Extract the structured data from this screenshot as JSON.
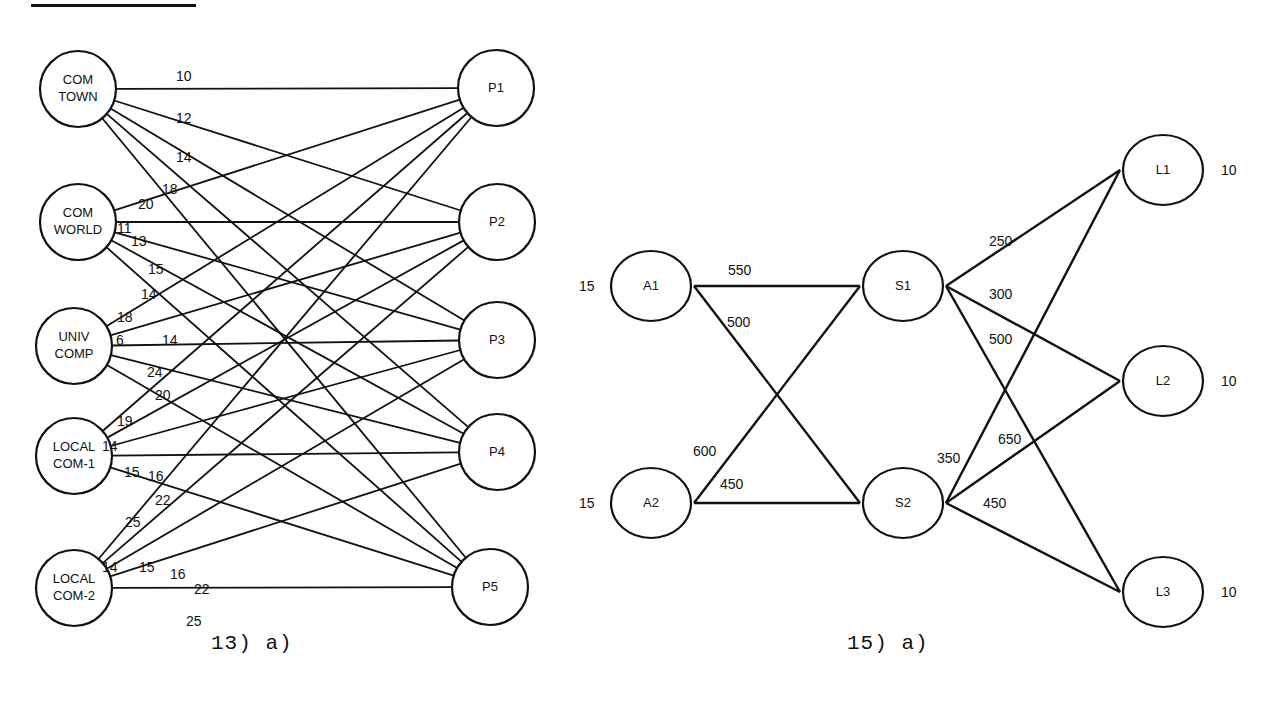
{
  "figures": [
    {
      "caption": "13) a)",
      "sources": [
        {
          "id": "ct",
          "line1": "COM",
          "line2": "TOWN",
          "cx": 78,
          "cy": 89
        },
        {
          "id": "cw",
          "line1": "COM",
          "line2": "WORLD",
          "cx": 78,
          "cy": 222
        },
        {
          "id": "uc",
          "line1": "UNIV",
          "line2": "COMP",
          "cx": 74,
          "cy": 346
        },
        {
          "id": "l1",
          "line1": "LOCAL",
          "line2": "COM-1",
          "cx": 74,
          "cy": 456
        },
        {
          "id": "l2",
          "line1": "LOCAL",
          "line2": "COM-2",
          "cx": 74,
          "cy": 588
        }
      ],
      "destinations": [
        {
          "id": "p1",
          "label": "P1",
          "cx": 496,
          "cy": 88
        },
        {
          "id": "p2",
          "label": "P2",
          "cx": 497,
          "cy": 222
        },
        {
          "id": "p3",
          "label": "P3",
          "cx": 497,
          "cy": 340
        },
        {
          "id": "p4",
          "label": "P4",
          "cx": 497,
          "cy": 452
        },
        {
          "id": "p5",
          "label": "P5",
          "cx": 490,
          "cy": 587
        }
      ],
      "costs": {
        "COM TOWN": [
          "10",
          "12",
          "14",
          "18",
          "20"
        ],
        "COM WORLD": [
          "11",
          "13",
          "15",
          "14",
          "18"
        ],
        "UNIV COMP": [
          "6",
          "14",
          "24",
          "20",
          "19"
        ],
        "LOCAL COM-1": [
          "14",
          "15",
          "16",
          "22",
          "25"
        ],
        "LOCAL COM-2": [
          "14",
          "15",
          "16",
          "22",
          "25"
        ]
      },
      "cost_labels": [
        {
          "text": "10",
          "x": 176,
          "y": 81
        },
        {
          "text": "12",
          "x": 176,
          "y": 123
        },
        {
          "text": "14",
          "x": 176,
          "y": 162
        },
        {
          "text": "18",
          "x": 162,
          "y": 194
        },
        {
          "text": "20",
          "x": 138,
          "y": 209
        },
        {
          "text": "11",
          "x": 117,
          "y": 233
        },
        {
          "text": "13",
          "x": 131,
          "y": 246
        },
        {
          "text": "15",
          "x": 148,
          "y": 274
        },
        {
          "text": "14",
          "x": 141,
          "y": 299
        },
        {
          "text": "18",
          "x": 117,
          "y": 322
        },
        {
          "text": "6",
          "x": 116,
          "y": 345
        },
        {
          "text": "14",
          "x": 162,
          "y": 345
        },
        {
          "text": "24",
          "x": 147,
          "y": 377
        },
        {
          "text": "20",
          "x": 155,
          "y": 400
        },
        {
          "text": "19",
          "x": 117,
          "y": 426
        },
        {
          "text": "14",
          "x": 102,
          "y": 451
        },
        {
          "text": "15",
          "x": 124,
          "y": 477
        },
        {
          "text": "16",
          "x": 148,
          "y": 481
        },
        {
          "text": "22",
          "x": 155,
          "y": 505
        },
        {
          "text": "25",
          "x": 125,
          "y": 527
        },
        {
          "text": "14",
          "x": 102,
          "y": 572
        },
        {
          "text": "15",
          "x": 139,
          "y": 572
        },
        {
          "text": "16",
          "x": 170,
          "y": 579
        },
        {
          "text": "22",
          "x": 194,
          "y": 594
        },
        {
          "text": "25",
          "x": 186,
          "y": 626
        }
      ]
    },
    {
      "caption": "15) a)",
      "nodes": [
        {
          "id": "a1",
          "label": "A1",
          "cx": 651,
          "cy": 286,
          "side_value": "15",
          "side": "left"
        },
        {
          "id": "a2",
          "label": "A2",
          "cx": 651,
          "cy": 503,
          "side_value": "15",
          "side": "left"
        },
        {
          "id": "s1",
          "label": "S1",
          "cx": 903,
          "cy": 286
        },
        {
          "id": "s2",
          "label": "S2",
          "cx": 903,
          "cy": 503
        },
        {
          "id": "L1",
          "label": "L1",
          "cx": 1163,
          "cy": 170,
          "side_value": "10",
          "side": "right"
        },
        {
          "id": "L2",
          "label": "L2",
          "cx": 1163,
          "cy": 381,
          "side_value": "10",
          "side": "right"
        },
        {
          "id": "L3",
          "label": "L3",
          "cx": 1163,
          "cy": 592,
          "side_value": "10",
          "side": "right"
        }
      ],
      "edges": [
        {
          "from": "A1",
          "to": "S1",
          "cost": "550"
        },
        {
          "from": "A1",
          "to": "S2",
          "cost": "500"
        },
        {
          "from": "A2",
          "to": "S1",
          "cost": "600"
        },
        {
          "from": "A2",
          "to": "S2",
          "cost": "450"
        },
        {
          "from": "S1",
          "to": "L1",
          "cost": "250"
        },
        {
          "from": "S1",
          "to": "L2",
          "cost": "300"
        },
        {
          "from": "S1",
          "to": "L3",
          "cost": "500"
        },
        {
          "from": "S2",
          "to": "L1",
          "cost": "350"
        },
        {
          "from": "S2",
          "to": "L2",
          "cost": "650"
        },
        {
          "from": "S2",
          "to": "L3",
          "cost": "450"
        }
      ],
      "cost_labels": [
        {
          "text": "550",
          "x": 728,
          "y": 275
        },
        {
          "text": "500",
          "x": 727,
          "y": 327
        },
        {
          "text": "600",
          "x": 693,
          "y": 456
        },
        {
          "text": "450",
          "x": 720,
          "y": 489
        },
        {
          "text": "250",
          "x": 989,
          "y": 246
        },
        {
          "text": "300",
          "x": 989,
          "y": 299
        },
        {
          "text": "500",
          "x": 989,
          "y": 344
        },
        {
          "text": "350",
          "x": 937,
          "y": 463
        },
        {
          "text": "650",
          "x": 998,
          "y": 444
        },
        {
          "text": "450",
          "x": 983,
          "y": 508
        }
      ]
    }
  ]
}
